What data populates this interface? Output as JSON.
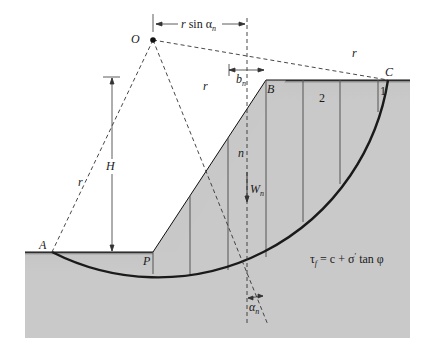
{
  "figure": {
    "points": {
      "O": "O",
      "A": "A",
      "B": "B",
      "C": "C",
      "P": "P"
    },
    "labels": {
      "r_sin_alpha_prefix": "r",
      "r_sin_alpha_mid": " sin α",
      "r_sin_alpha_sub": "n",
      "r": "r",
      "H": "H",
      "b": "b",
      "b_sub": "n",
      "n": "n",
      "W": "W",
      "W_sub": "n",
      "alpha": "α",
      "alpha_sub": "n",
      "slice_1": "1",
      "slice_2": "2"
    },
    "equation": {
      "tau": "τ",
      "tau_sub": "f",
      "rhs_c": " = c + σ",
      "prime": "′",
      "rhs_rest": " tan φ"
    },
    "colors": {
      "soil": "#c8c8c8",
      "soil_dark": "#2a2a2a",
      "line": "#222222"
    }
  }
}
